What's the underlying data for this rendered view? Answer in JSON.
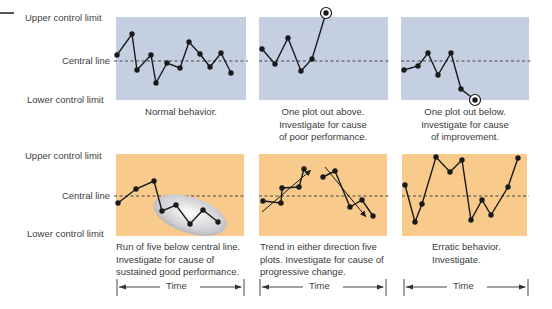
{
  "axis_labels": {
    "upper": "Upper control limit",
    "central": "Central line",
    "lower": "Lower control limit"
  },
  "time_label": "Time",
  "colors": {
    "blue_panel": "#C5CFE2",
    "orange_panel": "#F8CB8C",
    "line": "#1a1a1a",
    "dashed": "#444444",
    "ellipse_fill": "#d9d9dc"
  },
  "panels": [
    {
      "id": "normal",
      "row": 1,
      "caption": [
        "Normal behavior."
      ],
      "points": [
        [
          117,
          55
        ],
        [
          132,
          34
        ],
        [
          137,
          70
        ],
        [
          151,
          55
        ],
        [
          156,
          83
        ],
        [
          167,
          63
        ],
        [
          180,
          68
        ],
        [
          189,
          42
        ],
        [
          200,
          54
        ],
        [
          210,
          67
        ],
        [
          221,
          53
        ],
        [
          231,
          73
        ]
      ]
    },
    {
      "id": "one-above",
      "row": 1,
      "caption": [
        "One plot out above.",
        "Investigate for cause",
        "of poor performance."
      ],
      "points": [
        [
          262,
          49
        ],
        [
          275,
          64
        ],
        [
          288,
          38
        ],
        [
          301,
          71
        ],
        [
          312,
          59
        ],
        [
          326,
          13
        ]
      ],
      "circled": [
        326,
        13
      ]
    },
    {
      "id": "one-below",
      "row": 1,
      "caption": [
        "One plot out below.",
        "Investigate for cause",
        "of improvement."
      ],
      "points": [
        [
          404,
          70
        ],
        [
          418,
          66
        ],
        [
          428,
          53
        ],
        [
          438,
          75
        ],
        [
          451,
          53
        ],
        [
          461,
          89
        ],
        [
          475,
          100
        ]
      ],
      "circled": [
        475,
        100
      ]
    },
    {
      "id": "run-of-five",
      "row": 2,
      "caption": [
        "Run of five below central line.",
        "Investigate for cause of",
        "sustained good performance."
      ],
      "points": [
        [
          118,
          203
        ],
        [
          136,
          189
        ],
        [
          154,
          181
        ],
        [
          162,
          211
        ],
        [
          176,
          205
        ],
        [
          190,
          224
        ],
        [
          203,
          210
        ],
        [
          218,
          222
        ]
      ],
      "ellipse": {
        "cx": 190,
        "cy": 215,
        "rx": 38,
        "ry": 18,
        "rotate": 18
      }
    },
    {
      "id": "trend",
      "row": 2,
      "caption": [
        "Trend in either direction five",
        "plots. Investigate for cause of",
        "progressive change."
      ],
      "series": [
        [
          [
            263,
            201
          ],
          [
            281,
            203
          ],
          [
            282,
            188
          ],
          [
            299,
            187
          ],
          [
            304,
            169
          ]
        ],
        [
          [
            323,
            177
          ],
          [
            335,
            171
          ],
          [
            350,
            207
          ],
          [
            362,
            200
          ],
          [
            373,
            216
          ]
        ]
      ],
      "arrows": [
        [
          [
            262,
            212
          ],
          [
            311,
            170
          ]
        ],
        [
          [
            325,
            167
          ],
          [
            366,
            217
          ]
        ]
      ]
    },
    {
      "id": "erratic",
      "row": 2,
      "caption": [
        "Erratic behavior.",
        "Investigate."
      ],
      "points": [
        [
          405,
          185
        ],
        [
          415,
          222
        ],
        [
          422,
          204
        ],
        [
          436,
          157
        ],
        [
          450,
          172
        ],
        [
          462,
          160
        ],
        [
          471,
          220
        ],
        [
          482,
          200
        ],
        [
          491,
          215
        ],
        [
          508,
          187
        ],
        [
          518,
          158
        ]
      ]
    }
  ]
}
